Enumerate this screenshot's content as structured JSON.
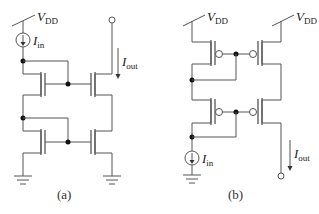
{
  "figure": {
    "panels": [
      {
        "id": "a",
        "caption": "(a)",
        "supply": {
          "symbol": "V",
          "subscript": "DD"
        },
        "input_current": {
          "symbol": "I",
          "subscript": "in"
        },
        "output_current": {
          "symbol": "I",
          "subscript": "out"
        },
        "device_type": "NMOS cascode current mirror"
      },
      {
        "id": "b",
        "caption": "(b)",
        "supplies": [
          {
            "symbol": "V",
            "subscript": "DD"
          },
          {
            "symbol": "V",
            "subscript": "DD"
          }
        ],
        "input_current": {
          "symbol": "I",
          "subscript": "in"
        },
        "output_current": {
          "symbol": "I",
          "subscript": "out"
        },
        "device_type": "PMOS cascode current mirror"
      }
    ],
    "colors": {
      "wire": "#555555",
      "node": "#111111",
      "text": "#222222",
      "background": "#ffffff"
    }
  }
}
